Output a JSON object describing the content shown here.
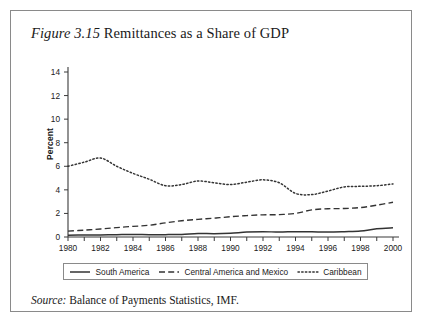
{
  "figure": {
    "label": "Figure",
    "number": "3.15",
    "title": "Remittances as a Share of GDP",
    "source_label": "Source:",
    "source_text": "Balance of Payments Statistics, IMF."
  },
  "chart_data": {
    "type": "line",
    "title": "Remittances as a Share of GDP",
    "xlabel": "",
    "ylabel": "Percent",
    "xlim": [
      1980,
      2000
    ],
    "ylim": [
      0,
      14
    ],
    "ytick_step": 2,
    "xtick_step": 2,
    "grid": false,
    "legend_position": "bottom",
    "yticks": [
      "0",
      "2",
      "4",
      "6",
      "8",
      "10",
      "12",
      "14"
    ],
    "xticks": [
      "1980",
      "1982",
      "1984",
      "1986",
      "1988",
      "1990",
      "1992",
      "1994",
      "1996",
      "1998",
      "2000"
    ],
    "x": [
      1980,
      1981,
      1982,
      1983,
      1984,
      1985,
      1986,
      1987,
      1988,
      1989,
      1990,
      1991,
      1992,
      1993,
      1994,
      1995,
      1996,
      1997,
      1998,
      1999,
      2000
    ],
    "series": [
      {
        "name": "South America",
        "style": "solid",
        "color": "#333333",
        "values": [
          0.15,
          0.17,
          0.18,
          0.2,
          0.22,
          0.2,
          0.2,
          0.22,
          0.3,
          0.28,
          0.32,
          0.42,
          0.45,
          0.42,
          0.45,
          0.44,
          0.42,
          0.45,
          0.5,
          0.7,
          0.78
        ]
      },
      {
        "name": "Central America and Mexico",
        "style": "dashed",
        "color": "#333333",
        "values": [
          0.5,
          0.58,
          0.68,
          0.8,
          0.9,
          1.0,
          1.2,
          1.38,
          1.5,
          1.6,
          1.72,
          1.82,
          1.88,
          1.9,
          2.0,
          2.3,
          2.4,
          2.42,
          2.5,
          2.7,
          2.95
        ]
      },
      {
        "name": "Caribbean",
        "style": "dotted",
        "color": "#333333",
        "values": [
          6.0,
          6.35,
          6.7,
          6.0,
          5.4,
          4.9,
          4.35,
          4.45,
          4.75,
          4.6,
          4.45,
          4.65,
          4.85,
          4.6,
          3.7,
          3.6,
          3.9,
          4.25,
          4.3,
          4.35,
          4.5
        ]
      }
    ],
    "caribbean_full": [
      6.0,
      6.35,
      6.7,
      6.0,
      5.4,
      4.9,
      4.35,
      4.45,
      4.75,
      4.6,
      4.45,
      4.65,
      4.85,
      4.6,
      3.7,
      3.6,
      3.9,
      4.25,
      4.3,
      4.35,
      4.5
    ]
  },
  "legend": {
    "items": [
      {
        "label": "South America",
        "style": "solid"
      },
      {
        "label": "Central America and Mexico",
        "style": "dashed"
      },
      {
        "label": "Caribbean",
        "style": "dotted"
      }
    ]
  }
}
